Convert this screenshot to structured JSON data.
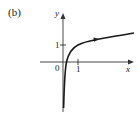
{
  "figure": {
    "panel_label": "(b)",
    "axes": {
      "x_label": "x",
      "y_label": "y",
      "origin_label": "0",
      "x_tick_label": "1",
      "y_tick_label": "1"
    },
    "curve": {
      "description": "logarithmic curve y = 1 + ln x, vertical asymptote at x = 0, passes through (1, 1)",
      "color": "#1a1a1a"
    }
  }
}
